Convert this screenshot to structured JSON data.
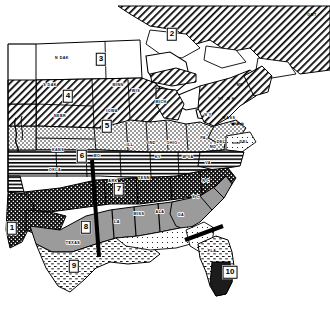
{
  "figure": {
    "type": "thematic-region-map",
    "width": 330,
    "height": 324,
    "background_color": "#ffffff",
    "line_color": "#000000"
  },
  "regions": [
    {
      "id": "1",
      "label": "1",
      "x": 12,
      "y": 228,
      "fill_pattern": "checker-dark",
      "name": "region-1"
    },
    {
      "id": "2",
      "label": "2",
      "x": 172,
      "y": 34,
      "fill_pattern": "diagonal-hatch",
      "name": "region-2"
    },
    {
      "id": "3",
      "label": "3",
      "x": 101,
      "y": 59,
      "fill_pattern": "white",
      "name": "region-3"
    },
    {
      "id": "4",
      "label": "4",
      "x": 68,
      "y": 96,
      "fill_pattern": "diagonal-hatch",
      "name": "region-4"
    },
    {
      "id": "5",
      "label": "5",
      "x": 107,
      "y": 126,
      "fill_pattern": "stipple",
      "name": "region-5"
    },
    {
      "id": "6",
      "label": "6",
      "x": 82,
      "y": 156,
      "fill_pattern": "horizontal-lines",
      "name": "region-6"
    },
    {
      "id": "7",
      "label": "7",
      "x": 119,
      "y": 189,
      "fill_pattern": "checker-dark",
      "name": "region-7"
    },
    {
      "id": "8",
      "label": "8",
      "x": 86,
      "y": 227,
      "fill_pattern": "gray-solid",
      "name": "region-8"
    },
    {
      "id": "9",
      "label": "9",
      "x": 74,
      "y": 266,
      "fill_pattern": "fine-dash",
      "name": "region-9"
    },
    {
      "id": "10",
      "label": "10",
      "x": 230,
      "y": 272,
      "fill_pattern": "dark-solid",
      "name": "region-10"
    }
  ],
  "state_labels": [
    {
      "text": "N DAK",
      "x": 62,
      "y": 58
    },
    {
      "text": "MINN",
      "x": 118,
      "y": 85
    },
    {
      "text": "WIS",
      "x": 136,
      "y": 91
    },
    {
      "text": "S DAK",
      "x": 50,
      "y": 85
    },
    {
      "text": "NEBR",
      "x": 60,
      "y": 116
    },
    {
      "text": "IOWA",
      "x": 112,
      "y": 111
    },
    {
      "text": "KANS",
      "x": 58,
      "y": 150
    },
    {
      "text": "OKLA",
      "x": 55,
      "y": 170
    },
    {
      "text": "MO",
      "x": 97,
      "y": 156
    },
    {
      "text": "ILL",
      "x": 130,
      "y": 145
    },
    {
      "text": "IND",
      "x": 152,
      "y": 143
    },
    {
      "text": "OHIO",
      "x": 172,
      "y": 143
    },
    {
      "text": "KY",
      "x": 158,
      "y": 157
    },
    {
      "text": "W VA",
      "x": 188,
      "y": 157
    },
    {
      "text": "MICH",
      "x": 161,
      "y": 102
    },
    {
      "text": "PA",
      "x": 203,
      "y": 138
    },
    {
      "text": "N Y",
      "x": 208,
      "y": 115
    },
    {
      "text": "VA",
      "x": 208,
      "y": 163
    },
    {
      "text": "TENN",
      "x": 144,
      "y": 178
    },
    {
      "text": "ARK",
      "x": 113,
      "y": 181
    },
    {
      "text": "MISS",
      "x": 139,
      "y": 214
    },
    {
      "text": "ALA",
      "x": 160,
      "y": 212
    },
    {
      "text": "LA",
      "x": 117,
      "y": 222
    },
    {
      "text": "TEXAS",
      "x": 73,
      "y": 243
    },
    {
      "text": "GA",
      "x": 181,
      "y": 215
    },
    {
      "text": "S C",
      "x": 196,
      "y": 197
    },
    {
      "text": "N C",
      "x": 206,
      "y": 181
    },
    {
      "text": "FLA",
      "x": 212,
      "y": 251
    },
    {
      "text": "MD",
      "x": 213,
      "y": 147
    },
    {
      "text": "DEL",
      "x": 221,
      "y": 142
    }
  ],
  "external_labels": [
    {
      "text": "ONT",
      "x": 312,
      "y": 15,
      "name": "ontario-label"
    },
    {
      "text": "R I",
      "x": 240,
      "y": 124,
      "name": "rhode-island-label"
    },
    {
      "text": "DEL",
      "x": 244,
      "y": 142,
      "name": "delaware-leader-label"
    },
    {
      "text": "MASS",
      "x": 229,
      "y": 118,
      "name": "massachusetts-label"
    },
    {
      "text": "N H",
      "x": 231,
      "y": 99,
      "name": "new-hampshire-label"
    },
    {
      "text": "VT",
      "x": 221,
      "y": 99,
      "name": "vermont-label"
    },
    {
      "text": "ME",
      "x": 240,
      "y": 85,
      "name": "maine-label"
    }
  ],
  "pointer_lines": [
    {
      "name": "pointer-line-west",
      "x1": 92,
      "y1": 160,
      "x2": 99,
      "y2": 257,
      "thickness": 4
    },
    {
      "name": "pointer-line-southeast",
      "x1": 185,
      "y1": 240,
      "x2": 223,
      "y2": 226,
      "thickness": 4
    }
  ],
  "legend_note": ""
}
